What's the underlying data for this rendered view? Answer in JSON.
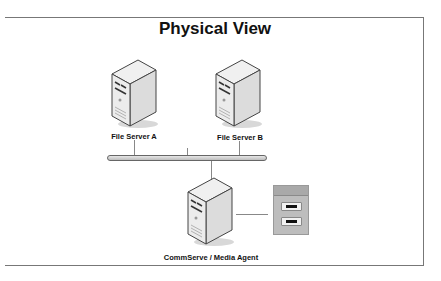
{
  "diagram": {
    "title": "Physical View",
    "nodes": [
      {
        "id": "file-server-a",
        "type": "server",
        "label": "File Server A"
      },
      {
        "id": "file-server-b",
        "type": "server",
        "label": "File Server B"
      },
      {
        "id": "commserve",
        "type": "server",
        "label": "CommServe / Media Agent"
      },
      {
        "id": "tape-library",
        "type": "tape-library",
        "label": ""
      }
    ],
    "edges": [
      {
        "from": "file-server-a",
        "to": "network-bus"
      },
      {
        "from": "file-server-b",
        "to": "network-bus"
      },
      {
        "from": "network-bus",
        "to": "commserve"
      },
      {
        "from": "commserve",
        "to": "tape-library"
      }
    ],
    "colors": {
      "frame": "#777777",
      "bus": "#c8c8c8",
      "server_body": "#e6e6e6",
      "library": "#bdbdbd"
    }
  }
}
